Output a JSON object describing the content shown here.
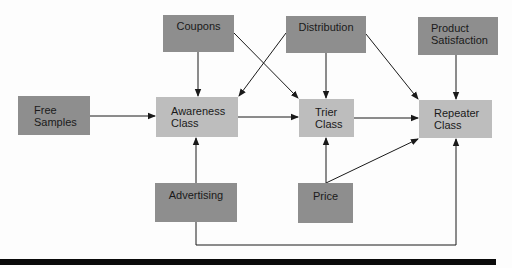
{
  "diagram": {
    "type": "flow-diagram",
    "colors": {
      "input_node": "#8e8e8e",
      "class_node": "#bdbdbd",
      "edge": "#1a1a1a",
      "rule": "#0a0a0a"
    },
    "nodes": [
      {
        "id": "coupons",
        "label": "Coupons",
        "kind": "input"
      },
      {
        "id": "distribution",
        "label": "Distribution",
        "kind": "input"
      },
      {
        "id": "product_satisfaction",
        "label": "Product\nSatisfaction",
        "kind": "input"
      },
      {
        "id": "free_samples",
        "label": "Free\nSamples",
        "kind": "input"
      },
      {
        "id": "awareness_class",
        "label": "Awareness\nClass",
        "kind": "class"
      },
      {
        "id": "trier_class",
        "label": "Trier\nClass",
        "kind": "class"
      },
      {
        "id": "repeater_class",
        "label": "Repeater\nClass",
        "kind": "class"
      },
      {
        "id": "advertising",
        "label": "Advertising",
        "kind": "input"
      },
      {
        "id": "price",
        "label": "Price",
        "kind": "input"
      }
    ],
    "edges": [
      {
        "from": "coupons",
        "to": "awareness_class"
      },
      {
        "from": "coupons",
        "to": "trier_class"
      },
      {
        "from": "distribution",
        "to": "awareness_class"
      },
      {
        "from": "distribution",
        "to": "trier_class"
      },
      {
        "from": "distribution",
        "to": "repeater_class"
      },
      {
        "from": "product_satisfaction",
        "to": "repeater_class"
      },
      {
        "from": "free_samples",
        "to": "awareness_class"
      },
      {
        "from": "awareness_class",
        "to": "trier_class"
      },
      {
        "from": "trier_class",
        "to": "repeater_class"
      },
      {
        "from": "advertising",
        "to": "awareness_class"
      },
      {
        "from": "advertising",
        "to": "repeater_class"
      },
      {
        "from": "price",
        "to": "trier_class"
      },
      {
        "from": "price",
        "to": "repeater_class"
      }
    ]
  }
}
